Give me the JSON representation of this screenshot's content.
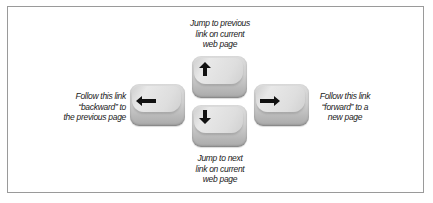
{
  "diagram": {
    "keys": [
      {
        "id": "up",
        "icon": "arrow-up-icon",
        "glyph": "↑"
      },
      {
        "id": "down",
        "icon": "arrow-down-icon",
        "glyph": "↓"
      },
      {
        "id": "left",
        "icon": "arrow-left-icon",
        "glyph": "←"
      },
      {
        "id": "right",
        "icon": "arrow-right-icon",
        "glyph": "→"
      }
    ],
    "labels": {
      "up": [
        "Jump to previous",
        "link on current",
        "web page"
      ],
      "down": [
        "Jump to next",
        "link on current",
        "web page"
      ],
      "left": [
        "Follow this link",
        "“backward” to",
        "the previous page"
      ],
      "right": [
        "Follow this link",
        "“forward” to a",
        "new page"
      ]
    },
    "colors": {
      "frame_border": "#9a9a9a",
      "key_base": "#cfcfcf",
      "arrow": "#111111",
      "text": "#1a1a1a"
    }
  }
}
